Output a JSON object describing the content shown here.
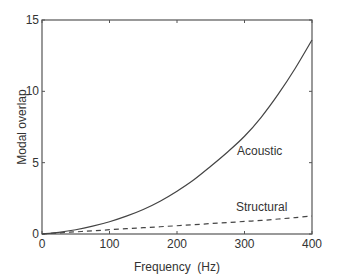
{
  "chart_data": {
    "type": "line",
    "title": "",
    "xlabel": "Frequency  (Hz)",
    "ylabel": "Modal overlap",
    "xlim": [
      0,
      400
    ],
    "ylim": [
      0,
      15
    ],
    "xticks": [
      0,
      100,
      200,
      300,
      400
    ],
    "yticks": [
      0,
      5,
      10,
      15
    ],
    "grid": false,
    "legend": "inline labels",
    "x": [
      0,
      25,
      50,
      75,
      100,
      125,
      150,
      175,
      200,
      225,
      250,
      275,
      300,
      325,
      350,
      375,
      400
    ],
    "series": [
      {
        "name": "Acoustic",
        "style": "solid",
        "values": [
          0,
          0.12,
          0.3,
          0.55,
          0.86,
          1.25,
          1.72,
          2.3,
          3.0,
          3.8,
          4.75,
          5.75,
          6.85,
          8.2,
          9.8,
          11.6,
          13.6
        ]
      },
      {
        "name": "Structural",
        "style": "dashed",
        "values": [
          0,
          0.08,
          0.15,
          0.22,
          0.3,
          0.37,
          0.44,
          0.51,
          0.58,
          0.65,
          0.73,
          0.8,
          0.88,
          0.95,
          1.05,
          1.15,
          1.26
        ]
      }
    ],
    "annotations": [
      {
        "text": "Acoustic",
        "x": 290,
        "y": 6.0
      },
      {
        "text": "Structural",
        "x": 290,
        "y": 1.9
      }
    ]
  },
  "axes": {
    "xlabel": "Frequency  (Hz)",
    "ylabel": "Modal overlap",
    "xtick_labels": [
      "0",
      "100",
      "200",
      "300",
      "400"
    ],
    "ytick_labels": [
      "0",
      "5",
      "10",
      "15"
    ]
  },
  "labels": {
    "acoustic": "Acoustic",
    "structural": "Structural"
  },
  "colors": {
    "axis": "#555555",
    "line": "#444444",
    "text": "#333333"
  }
}
